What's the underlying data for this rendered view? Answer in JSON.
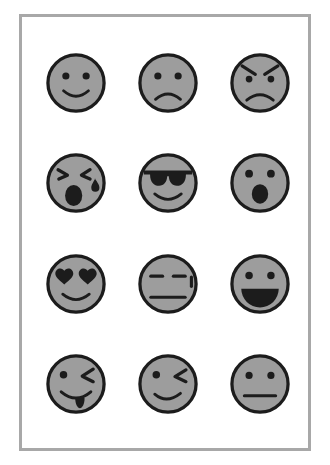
{
  "page": {
    "background_color": "#ffffff",
    "frame_border_color": "#a8a8a8",
    "face_fill_color": "#9d9d9d",
    "ink_color": "#1c1c1c",
    "grid_columns": 3,
    "grid_rows": 4,
    "face_count": 12
  },
  "faces": [
    {
      "id": "smiling-face",
      "name": "smiling face",
      "row": 1,
      "col": 1,
      "eyes": "round dots",
      "mouth": "smile curve",
      "extras": "none"
    },
    {
      "id": "frowning-face",
      "name": "frowning face",
      "row": 1,
      "col": 2,
      "eyes": "round dots",
      "mouth": "frown curve",
      "extras": "none"
    },
    {
      "id": "angry-face",
      "name": "angry face",
      "row": 1,
      "col": 3,
      "eyes": "round dots",
      "mouth": "frown curve",
      "extras": "angled eyebrows"
    },
    {
      "id": "crying-face",
      "name": "crying face with open mouth",
      "row": 2,
      "col": 1,
      "eyes": "squinted closed chevrons",
      "mouth": "open oval",
      "extras": "teardrop"
    },
    {
      "id": "cool-face",
      "name": "smiling face with sunglasses",
      "row": 2,
      "col": 2,
      "eyes": "sunglasses",
      "mouth": "smile curve",
      "extras": "none"
    },
    {
      "id": "surprised-face",
      "name": "face with open mouth",
      "row": 2,
      "col": 3,
      "eyes": "round dots",
      "mouth": "open oval",
      "extras": "none"
    },
    {
      "id": "heart-eyes-face",
      "name": "smiling face with heart eyes",
      "row": 3,
      "col": 1,
      "eyes": "hearts",
      "mouth": "smile curve",
      "extras": "none"
    },
    {
      "id": "unamused-face",
      "name": "unamused face with sweat drop",
      "row": 3,
      "col": 2,
      "eyes": "flat dashes",
      "mouth": "straight line",
      "extras": "sweat mark"
    },
    {
      "id": "grinning-face",
      "name": "grinning face with open mouth",
      "row": 3,
      "col": 3,
      "eyes": "round dots",
      "mouth": "open half-disc grin",
      "extras": "none"
    },
    {
      "id": "tongue-wink-face",
      "name": "winking face with tongue out",
      "row": 4,
      "col": 1,
      "eyes": "left dot, right wink",
      "mouth": "smile curve",
      "extras": "tongue"
    },
    {
      "id": "winking-face",
      "name": "winking face",
      "row": 4,
      "col": 2,
      "eyes": "left dot, right wink",
      "mouth": "smirk curve",
      "extras": "none"
    },
    {
      "id": "neutral-face",
      "name": "neutral face",
      "row": 4,
      "col": 3,
      "eyes": "round dots",
      "mouth": "straight line",
      "extras": "none"
    }
  ]
}
